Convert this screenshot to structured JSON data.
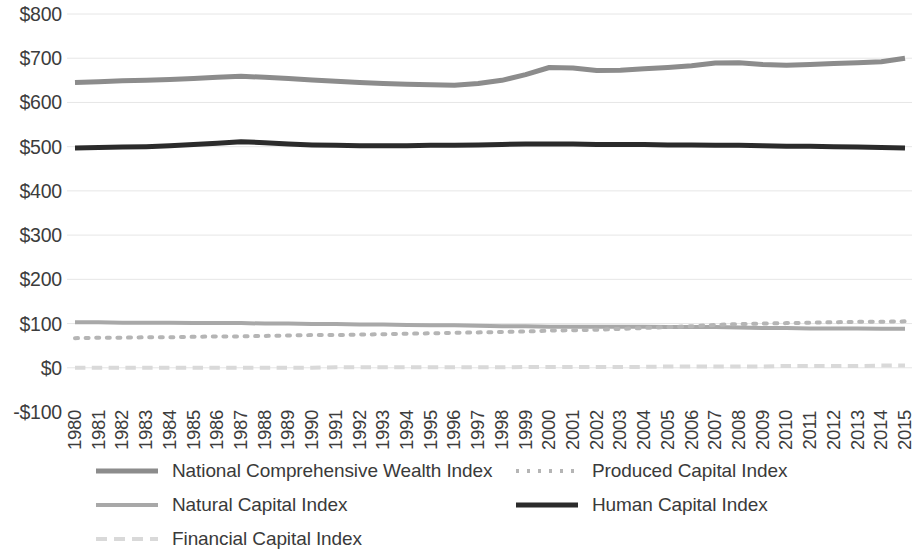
{
  "chart_data": {
    "type": "line",
    "title": "",
    "xlabel": "",
    "ylabel": "",
    "ylim": [
      -100,
      800
    ],
    "ytick_labels": [
      "$800",
      "$700",
      "$600",
      "$500",
      "$400",
      "$300",
      "$200",
      "$100",
      "$0",
      "-$100"
    ],
    "ytick_values": [
      800,
      700,
      600,
      500,
      400,
      300,
      200,
      100,
      0,
      -100
    ],
    "grid": true,
    "grid_axis": "y",
    "legend_position": "bottom",
    "categories": [
      "1980",
      "1981",
      "1982",
      "1983",
      "1984",
      "1985",
      "1986",
      "1987",
      "1988",
      "1989",
      "1990",
      "1991",
      "1992",
      "1993",
      "1994",
      "1995",
      "1996",
      "1997",
      "1998",
      "1999",
      "2000",
      "2001",
      "2002",
      "2003",
      "2004",
      "2005",
      "2006",
      "2007",
      "2008",
      "2009",
      "2010",
      "2011",
      "2012",
      "2013",
      "2014",
      "2015"
    ],
    "series": [
      {
        "name": "National Comprehensive Wealth Index",
        "color": "#8c8c8c",
        "style": "solid",
        "width": 5,
        "values": [
          645,
          647,
          649,
          650,
          652,
          654,
          657,
          659,
          657,
          654,
          651,
          648,
          645,
          643,
          641,
          640,
          639,
          643,
          650,
          663,
          679,
          678,
          672,
          673,
          676,
          679,
          683,
          689,
          690,
          686,
          684,
          686,
          688,
          690,
          692,
          700
        ]
      },
      {
        "name": "Natural Capital Index",
        "color": "#a8a8a8",
        "style": "solid",
        "width": 4,
        "values": [
          103,
          103,
          102,
          102,
          102,
          101,
          101,
          101,
          100,
          100,
          99,
          99,
          98,
          98,
          97,
          96,
          96,
          95,
          94,
          94,
          93,
          93,
          93,
          93,
          93,
          92,
          92,
          92,
          91,
          90,
          90,
          89,
          89,
          89,
          88,
          88
        ]
      },
      {
        "name": "Financial Capital Index",
        "color": "#d9d9d9",
        "style": "dashed",
        "width": 4,
        "values": [
          0,
          0,
          0,
          0,
          0,
          0,
          0,
          0,
          0,
          0,
          0,
          1,
          1,
          1,
          1,
          1,
          1,
          1,
          1,
          2,
          2,
          2,
          2,
          2,
          2,
          3,
          3,
          3,
          3,
          3,
          4,
          4,
          4,
          4,
          5,
          5
        ]
      },
      {
        "name": "Produced Capital Index",
        "color": "#b5b5b5",
        "style": "dotted",
        "width": 4,
        "values": [
          67,
          68,
          68,
          69,
          69,
          70,
          71,
          71,
          72,
          73,
          74,
          74,
          75,
          76,
          77,
          78,
          79,
          80,
          81,
          82,
          84,
          85,
          86,
          88,
          90,
          92,
          94,
          97,
          99,
          100,
          101,
          102,
          103,
          104,
          104,
          105
        ]
      },
      {
        "name": "Human Capital Index",
        "color": "#2b2b2b",
        "style": "solid",
        "width": 5,
        "values": [
          497,
          498,
          499,
          500,
          502,
          505,
          508,
          511,
          509,
          506,
          504,
          503,
          502,
          502,
          502,
          503,
          503,
          504,
          505,
          506,
          506,
          506,
          505,
          505,
          505,
          504,
          504,
          503,
          503,
          502,
          501,
          501,
          500,
          499,
          498,
          497
        ]
      }
    ]
  },
  "legend": {
    "items": [
      {
        "label": "National Comprehensive Wealth Index",
        "color": "#8c8c8c",
        "style": "solid",
        "width": 5,
        "col": 0,
        "row": 0
      },
      {
        "label": "Natural Capital Index",
        "color": "#a8a8a8",
        "style": "solid",
        "width": 4,
        "col": 0,
        "row": 1
      },
      {
        "label": "Financial Capital Index",
        "color": "#d9d9d9",
        "style": "dashed",
        "width": 4,
        "col": 0,
        "row": 2
      },
      {
        "label": "Produced Capital Index",
        "color": "#b5b5b5",
        "style": "dotted",
        "width": 4,
        "col": 1,
        "row": 0
      },
      {
        "label": "Human Capital Index",
        "color": "#2b2b2b",
        "style": "solid",
        "width": 5,
        "col": 1,
        "row": 1
      }
    ]
  },
  "axes": {
    "grid_color": "#e6e6e6",
    "tick_color": "#3c3c3c"
  }
}
